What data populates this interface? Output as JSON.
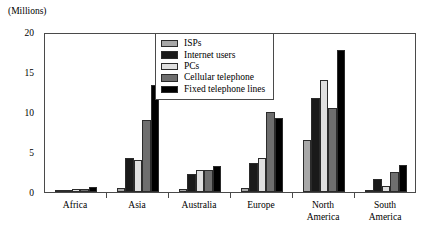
{
  "chart_data": {
    "type": "bar",
    "title": "(Millions)",
    "xlabel": "",
    "ylabel": "(Millions)",
    "ylim": [
      0,
      20
    ],
    "yticks": [
      0,
      5,
      10,
      15,
      20
    ],
    "ytick_labels": [
      "0",
      "5",
      "10",
      "15",
      "20"
    ],
    "grid": false,
    "legend_position": "top-center",
    "categories": [
      "Africa",
      "Asia",
      "Australia",
      "Europe",
      "North America",
      "South America"
    ],
    "series": [
      {
        "name": "ISPs",
        "color": "#a8a8a8",
        "values": [
          0.15,
          0.5,
          0.4,
          0.5,
          6.5,
          0.15
        ]
      },
      {
        "name": "Internet users",
        "color": "#1a1a1a",
        "values": [
          0.3,
          4.3,
          2.2,
          3.6,
          11.8,
          1.6
        ]
      },
      {
        "name": "PCs",
        "color": "#e0e0e0",
        "values": [
          0.35,
          4.0,
          2.8,
          4.2,
          14.0,
          0.8
        ]
      },
      {
        "name": "Cellular telephone",
        "color": "#6e6e6e",
        "values": [
          0.4,
          9.0,
          2.8,
          10.0,
          10.5,
          2.5
        ]
      },
      {
        "name": "Fixed telephone lines",
        "color": "#000000",
        "values": [
          0.6,
          13.4,
          3.3,
          9.2,
          17.8,
          3.4
        ]
      }
    ]
  }
}
